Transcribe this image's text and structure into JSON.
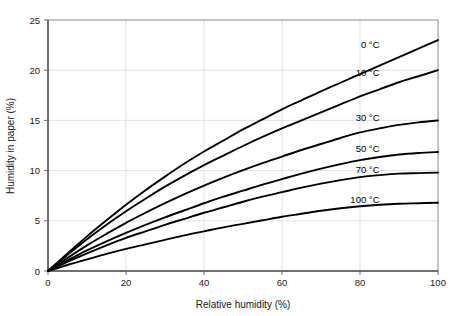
{
  "chart_data": {
    "type": "line",
    "title": "",
    "xlabel": "Relative humidity (%)",
    "ylabel": "Humidity in paper (%)",
    "xlim": [
      0,
      100
    ],
    "ylim": [
      0,
      25
    ],
    "xticks": [
      0,
      20,
      40,
      60,
      80,
      100
    ],
    "yticks": [
      0,
      5,
      10,
      15,
      20,
      25
    ],
    "xtick_labels": [
      "0",
      "20",
      "40",
      "60",
      "80",
      "100"
    ],
    "ytick_labels": [
      "0",
      "5",
      "10",
      "15",
      "20",
      "25"
    ],
    "grid": true,
    "legend_position": "inline-right-of-curves",
    "x": [
      0,
      5,
      10,
      15,
      20,
      25,
      30,
      35,
      40,
      45,
      50,
      55,
      60,
      65,
      70,
      75,
      80,
      85,
      90,
      95,
      100
    ],
    "series": [
      {
        "name": "0 °C",
        "label": "0 °C",
        "label_x": 85,
        "label_y": 22.2,
        "values": [
          0.0,
          1.75,
          3.45,
          5.05,
          6.6,
          8.05,
          9.4,
          10.7,
          11.9,
          13.0,
          14.1,
          15.1,
          16.1,
          17.0,
          17.9,
          18.75,
          19.6,
          20.45,
          21.3,
          22.15,
          23.0
        ]
      },
      {
        "name": "10 °C",
        "label": "10 °C",
        "label_x": 85,
        "label_y": 19.4,
        "values": [
          0.0,
          1.6,
          3.15,
          4.6,
          5.95,
          7.2,
          8.4,
          9.5,
          10.55,
          11.5,
          12.45,
          13.35,
          14.2,
          15.0,
          15.8,
          16.6,
          17.4,
          18.1,
          18.8,
          19.4,
          20.0
        ]
      },
      {
        "name": "30 °C",
        "label": "30 °C",
        "label_x": 85,
        "label_y": 14.9,
        "values": [
          0.0,
          1.3,
          2.55,
          3.7,
          4.8,
          5.8,
          6.75,
          7.65,
          8.5,
          9.3,
          10.05,
          10.75,
          11.4,
          12.05,
          12.65,
          13.25,
          13.8,
          14.2,
          14.55,
          14.8,
          15.0
        ]
      },
      {
        "name": "50 °C",
        "label": "50 °C",
        "label_x": 85,
        "label_y": 11.85,
        "values": [
          0.0,
          1.05,
          2.05,
          2.95,
          3.8,
          4.6,
          5.35,
          6.05,
          6.75,
          7.4,
          8.0,
          8.6,
          9.15,
          9.7,
          10.2,
          10.65,
          11.05,
          11.35,
          11.6,
          11.75,
          11.85
        ]
      },
      {
        "name": "70 °C",
        "label": "70 °C",
        "label_x": 85,
        "label_y": 9.75,
        "values": [
          0.0,
          0.9,
          1.75,
          2.55,
          3.3,
          3.95,
          4.6,
          5.2,
          5.8,
          6.35,
          6.9,
          7.4,
          7.85,
          8.3,
          8.7,
          9.05,
          9.35,
          9.55,
          9.7,
          9.75,
          9.8
        ]
      },
      {
        "name": "100 °C",
        "label": "100 °C",
        "label_x": 85,
        "label_y": 6.75,
        "values": [
          0.0,
          0.6,
          1.15,
          1.7,
          2.2,
          2.65,
          3.1,
          3.55,
          3.95,
          4.35,
          4.7,
          5.05,
          5.4,
          5.7,
          6.0,
          6.25,
          6.45,
          6.6,
          6.7,
          6.75,
          6.8
        ]
      }
    ],
    "colors": {
      "series_stroke": "#000000",
      "grid": "#d9d9d9",
      "frame": "#8a8a8a",
      "text": "#1a1a1a",
      "background": "#ffffff"
    }
  },
  "plot_geometry": {
    "left": 48,
    "right": 438,
    "top": 20,
    "bottom": 271
  }
}
